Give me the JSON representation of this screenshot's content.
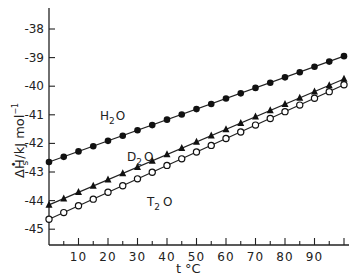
{
  "chart_data": {
    "type": "line",
    "title": "",
    "xlabel": "t °C",
    "ylabel": "ΔH°s / kJ mol⁻¹",
    "xlim": [
      0,
      100
    ],
    "ylim": [
      -45.5,
      -37.5
    ],
    "grid": false,
    "legend": "inline labels",
    "x_ticks": [
      10,
      20,
      30,
      40,
      50,
      60,
      70,
      80,
      90
    ],
    "x_minor_ticks_every": 5,
    "y_ticks": [
      -38,
      -39,
      -40,
      -41,
      -42,
      -43,
      -44,
      -45
    ],
    "y_tick_labels": [
      "-38",
      "-39",
      "-40",
      "-41",
      "-42",
      "-43",
      "-44",
      "-45"
    ],
    "x": [
      0,
      5,
      10,
      15,
      20,
      25,
      30,
      35,
      40,
      45,
      50,
      55,
      60,
      65,
      70,
      75,
      80,
      85,
      90,
      95,
      100
    ],
    "series": [
      {
        "name": "H2O",
        "label_main": "H",
        "label_sub": "2",
        "label_tail": "O",
        "marker": "filled-circle",
        "fit": {
          "intercept": -42.65,
          "slope": 0.037
        },
        "values": [
          -42.65,
          -42.47,
          -42.28,
          -42.1,
          -41.91,
          -41.73,
          -41.54,
          -41.36,
          -41.17,
          -40.99,
          -40.8,
          -40.62,
          -40.43,
          -40.25,
          -40.06,
          -39.88,
          -39.69,
          -39.51,
          -39.32,
          -39.14,
          -38.95
        ]
      },
      {
        "name": "D2O",
        "label_main": "D",
        "label_sub": "2",
        "label_tail": "O",
        "marker": "filled-triangle",
        "fit": {
          "intercept": -44.15,
          "slope": 0.044
        },
        "values": [
          -44.15,
          -43.93,
          -43.71,
          -43.49,
          -43.27,
          -43.05,
          -42.83,
          -42.61,
          -42.39,
          -42.17,
          -41.95,
          -41.73,
          -41.51,
          -41.29,
          -41.07,
          -40.85,
          -40.63,
          -40.41,
          -40.19,
          -39.97,
          -39.75
        ]
      },
      {
        "name": "T2O",
        "label_main": "T",
        "label_sub": "2",
        "label_tail": "O",
        "marker": "open-circle",
        "fit": {
          "intercept": -44.65,
          "slope": 0.047
        },
        "values": [
          -44.65,
          -44.42,
          -44.18,
          -43.95,
          -43.71,
          -43.48,
          -43.24,
          -43.01,
          -42.77,
          -42.54,
          -42.3,
          -42.07,
          -41.83,
          -41.6,
          -41.36,
          -41.13,
          -40.89,
          -40.66,
          -40.42,
          -40.19,
          -39.95
        ]
      }
    ]
  },
  "axes": {
    "y_title_delta": "Δ",
    "y_title_H": "H",
    "y_title_sup": "•",
    "y_title_sub": "s",
    "y_title_units": "/kJ mol",
    "y_title_exp": "−1",
    "x_title_t": "t",
    "x_title_unit": "°C"
  }
}
